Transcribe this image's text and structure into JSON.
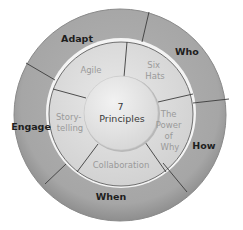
{
  "diagram": {
    "type": "concentric-wheel",
    "center": {
      "lines": [
        "7",
        "Principles"
      ]
    },
    "middle_ring": {
      "segments": [
        {
          "id": "agile",
          "lines": [
            "Agile"
          ]
        },
        {
          "id": "six-hats",
          "lines": [
            "Six",
            "Hats"
          ]
        },
        {
          "id": "power-of-why",
          "lines": [
            "The",
            "Power",
            "of",
            "Why"
          ]
        },
        {
          "id": "collaboration",
          "lines": [
            "Collaboration"
          ]
        },
        {
          "id": "storytelling",
          "lines": [
            "Story-",
            "telling"
          ]
        }
      ]
    },
    "outer_ring": {
      "segments": [
        {
          "id": "adapt",
          "label": "Adapt"
        },
        {
          "id": "who",
          "label": "Who"
        },
        {
          "id": "how",
          "label": "How"
        },
        {
          "id": "when",
          "label": "When"
        },
        {
          "id": "engage",
          "label": "Engage"
        }
      ]
    },
    "colors": {
      "outer_ring": "#a9a9a9",
      "middle_ring": "#dcdcdc",
      "center": "#e6e6e6",
      "divider": "#3c3c3c",
      "outer_text": "#1e1e1e",
      "middle_text": "#9a9a9a",
      "center_text": "#3a3a3a"
    }
  }
}
